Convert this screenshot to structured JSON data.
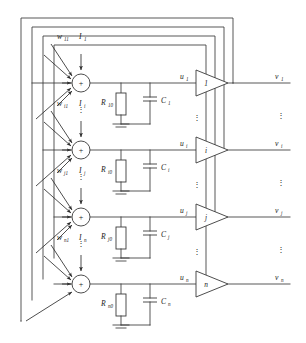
{
  "figure": {
    "type": "schematic",
    "width": 306,
    "height": 343,
    "line_color": "#3a3a3a",
    "background": "#ffffff"
  },
  "rows": [
    {
      "index": 0,
      "weight_label": "w",
      "weight_sub": "11",
      "current_label": "I",
      "current_sub": "1",
      "resistor_label": "R",
      "resistor_sub": "10",
      "capacitor_label": "C",
      "capacitor_sub": "1",
      "potential_label": "u",
      "potential_sub": "1",
      "amplifier_label": "1",
      "output_label": "v",
      "output_sub": "1",
      "node_symbol": "+"
    },
    {
      "index": 1,
      "weight_label": "w",
      "weight_sub": "i1",
      "current_label": "I",
      "current_sub": "i",
      "resistor_label": "R",
      "resistor_sub": "i0",
      "capacitor_label": "C",
      "capacitor_sub": "i",
      "potential_label": "u",
      "potential_sub": "i",
      "amplifier_label": "i",
      "output_label": "v",
      "output_sub": "i",
      "node_symbol": "+"
    },
    {
      "index": 2,
      "weight_label": "w",
      "weight_sub": "j1",
      "current_label": "I",
      "current_sub": "j",
      "resistor_label": "R",
      "resistor_sub": "j0",
      "capacitor_label": "C",
      "capacitor_sub": "j",
      "potential_label": "u",
      "potential_sub": "j",
      "amplifier_label": "j",
      "output_label": "v",
      "output_sub": "j",
      "node_symbol": "+"
    },
    {
      "index": 3,
      "weight_label": "w",
      "weight_sub": "n1",
      "current_label": "I",
      "current_sub": "n",
      "resistor_label": "R",
      "resistor_sub": "n0",
      "capacitor_label": "C",
      "capacitor_sub": "n",
      "potential_label": "u",
      "potential_sub": "n",
      "amplifier_label": "n",
      "output_label": "v",
      "output_sub": "n",
      "node_symbol": "+"
    }
  ],
  "ellipses": {
    "glyph": "⋮",
    "count_node_column": 3,
    "count_amp_column": 3,
    "count_output_column": 3
  },
  "feedback": {
    "loop_count": 4,
    "description": "nested rectangular feedback rails"
  }
}
